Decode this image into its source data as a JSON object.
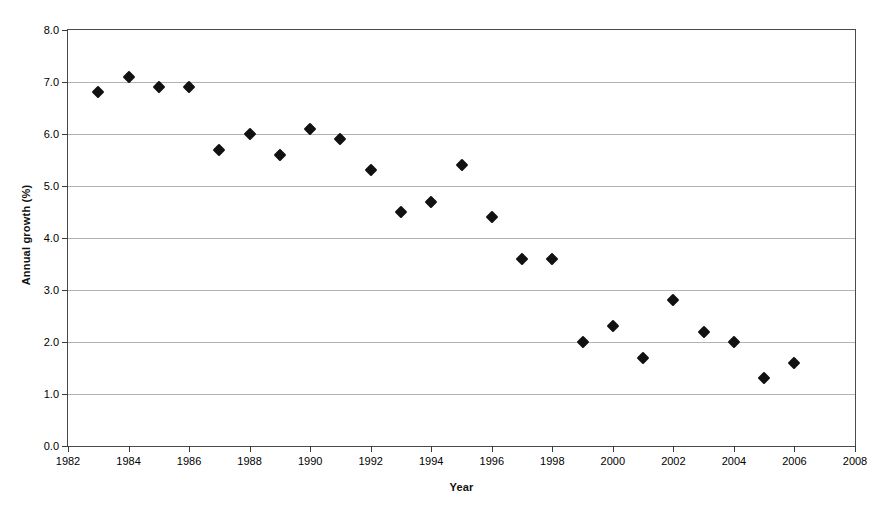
{
  "chart_data": {
    "type": "scatter",
    "title": "",
    "xlabel": "Year",
    "ylabel": "Annual growth (%)",
    "xlim": [
      1982,
      2008
    ],
    "ylim": [
      0.0,
      8.0
    ],
    "x_tick_labels": [
      "1982",
      "1984",
      "1986",
      "1988",
      "1990",
      "1992",
      "1994",
      "1996",
      "1998",
      "2000",
      "2002",
      "2004",
      "2006",
      "2008"
    ],
    "x_ticks": [
      1982,
      1984,
      1986,
      1988,
      1990,
      1992,
      1994,
      1996,
      1998,
      2000,
      2002,
      2004,
      2006,
      2008
    ],
    "y_tick_labels": [
      "0.0",
      "1.0",
      "2.0",
      "3.0",
      "4.0",
      "5.0",
      "6.0",
      "7.0",
      "8.0"
    ],
    "y_ticks": [
      0.0,
      1.0,
      2.0,
      3.0,
      4.0,
      5.0,
      6.0,
      7.0,
      8.0
    ],
    "grid": true,
    "legend": false,
    "marker": "diamond",
    "marker_color": "#111111",
    "x": [
      1983,
      1984,
      1985,
      1986,
      1987,
      1988,
      1989,
      1990,
      1991,
      1992,
      1993,
      1994,
      1995,
      1996,
      1997,
      1998,
      1999,
      2000,
      2001,
      2002,
      2003,
      2004,
      2005,
      2006
    ],
    "values": [
      6.8,
      7.1,
      6.9,
      6.9,
      5.7,
      6.0,
      5.6,
      6.1,
      5.9,
      5.3,
      4.5,
      4.7,
      5.4,
      4.4,
      3.6,
      3.6,
      2.0,
      2.3,
      1.7,
      2.8,
      2.2,
      2.0,
      1.3,
      1.6
    ]
  }
}
